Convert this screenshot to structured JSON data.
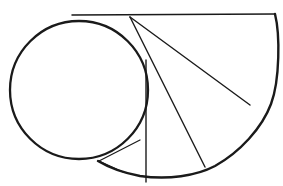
{
  "figure": {
    "background_color": "#ffffff",
    "stroke_color": "#1a1a1a",
    "canvas": {
      "width": 283,
      "height": 186
    }
  },
  "chart_data": {
    "type": "line",
    "subtitle": "",
    "xlabel": "",
    "ylabel": "",
    "xlim": [
      0,
      283
    ],
    "ylim": [
      0,
      186
    ],
    "grid": false,
    "legend": "none",
    "annotations": [],
    "shapes": [
      {
        "name": "base-circle",
        "kind": "circle",
        "center": [
          79,
          90
        ],
        "radius": 69,
        "stroke_width": 2.3
      },
      {
        "name": "spiral-arc",
        "kind": "arc",
        "description": "Large outer involute arc sweeping from the horizontal tangent line at upper right, clockwise down and around to the tangency point on the lower left of the base circle.",
        "points": [
          [
            275,
            14
          ],
          [
            279,
            60
          ],
          [
            271,
            104
          ],
          [
            250,
            140
          ],
          [
            215,
            166
          ],
          [
            178,
            178
          ],
          [
            140,
            176
          ],
          [
            115,
            168
          ],
          [
            98,
            161
          ]
        ],
        "stroke_width": 2.4
      },
      {
        "name": "horizontal-tangent-line",
        "kind": "line",
        "points": [
          [
            72,
            15
          ],
          [
            275,
            14
          ]
        ],
        "stroke_width": 1.5
      },
      {
        "name": "chord-to-upper-right",
        "kind": "line",
        "points": [
          [
            130,
            17
          ],
          [
            275,
            14
          ]
        ],
        "stroke_width": 1.4
      },
      {
        "name": "chord-to-right-arc",
        "kind": "line",
        "points": [
          [
            130,
            17
          ],
          [
            250,
            105
          ]
        ],
        "stroke_width": 1.4
      },
      {
        "name": "chord-to-lower-right-arc",
        "kind": "line",
        "points": [
          [
            130,
            17
          ],
          [
            205,
            167
          ]
        ],
        "stroke_width": 1.4
      },
      {
        "name": "chord-vertical",
        "kind": "line",
        "points": [
          [
            146,
            60
          ],
          [
            146,
            182
          ]
        ],
        "stroke_width": 1.4
      },
      {
        "name": "chord-to-tangent-point",
        "kind": "line",
        "points": [
          [
            140,
            140
          ],
          [
            99,
            161
          ]
        ],
        "stroke_width": 1.2
      },
      {
        "name": "chord-short-lower-left",
        "kind": "line",
        "points": [
          [
            123,
            172
          ],
          [
            99,
            161
          ]
        ],
        "stroke_width": 1.2
      }
    ]
  }
}
